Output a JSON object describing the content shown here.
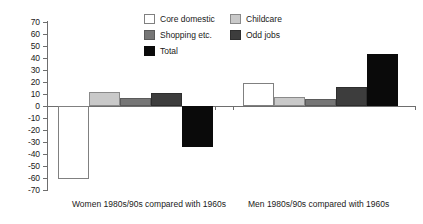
{
  "chart_data": {
    "type": "bar",
    "title": "",
    "subtitle": "",
    "xlabel": "",
    "ylabel": "",
    "ylim": [
      -70,
      70
    ],
    "ytick_step": 10,
    "grid": false,
    "legend_position": "top-center",
    "categories": [
      "Women 1980s/90s compared with 1960s",
      "Men 1980s/90s compared with 1960s"
    ],
    "series": [
      {
        "name": "Core domestic",
        "color": "#ffffff",
        "values": [
          -61,
          19
        ]
      },
      {
        "name": "Childcare",
        "color": "#c9c9c9",
        "values": [
          11.5,
          7.5
        ]
      },
      {
        "name": "Shopping etc.",
        "color": "#767676",
        "values": [
          6.5,
          5.5
        ]
      },
      {
        "name": "Odd jobs",
        "color": "#3d3d3d",
        "values": [
          10.5,
          15.5
        ]
      },
      {
        "name": "Total",
        "color": "#0a0a0a",
        "values": [
          -34,
          43.5
        ]
      }
    ],
    "ytick_labels": [
      "70",
      "60",
      "50",
      "40",
      "30",
      "20",
      "10",
      "0",
      "-10",
      "-20",
      "-30",
      "-40",
      "-50",
      "-60",
      "-70"
    ]
  },
  "axis": {
    "ticks": [
      {
        "label": "70",
        "value": 70
      },
      {
        "label": "60",
        "value": 60
      },
      {
        "label": "50",
        "value": 50
      },
      {
        "label": "40",
        "value": 40
      },
      {
        "label": "30",
        "value": 30
      },
      {
        "label": "20",
        "value": 20
      },
      {
        "label": "10",
        "value": 10
      },
      {
        "label": "0",
        "value": 0
      },
      {
        "label": "-10",
        "value": -10
      },
      {
        "label": "-20",
        "value": -20
      },
      {
        "label": "-30",
        "value": -30
      },
      {
        "label": "-40",
        "value": -40
      },
      {
        "label": "-50",
        "value": -50
      },
      {
        "label": "-60",
        "value": -60
      },
      {
        "label": "-70",
        "value": -70
      }
    ]
  },
  "legend": {
    "items": [
      {
        "label": "Core domestic",
        "swatch": "sw-core"
      },
      {
        "label": "Childcare",
        "swatch": "sw-childcare"
      },
      {
        "label": "Shopping etc.",
        "swatch": "sw-shopping"
      },
      {
        "label": "Odd jobs",
        "swatch": "sw-oddjobs"
      },
      {
        "label": "Total",
        "swatch": "sw-total"
      }
    ]
  },
  "x_labels": {
    "women": "Women 1980s/90s compared with 1960s",
    "men": "Men 1980s/90s compared with 1960s"
  }
}
